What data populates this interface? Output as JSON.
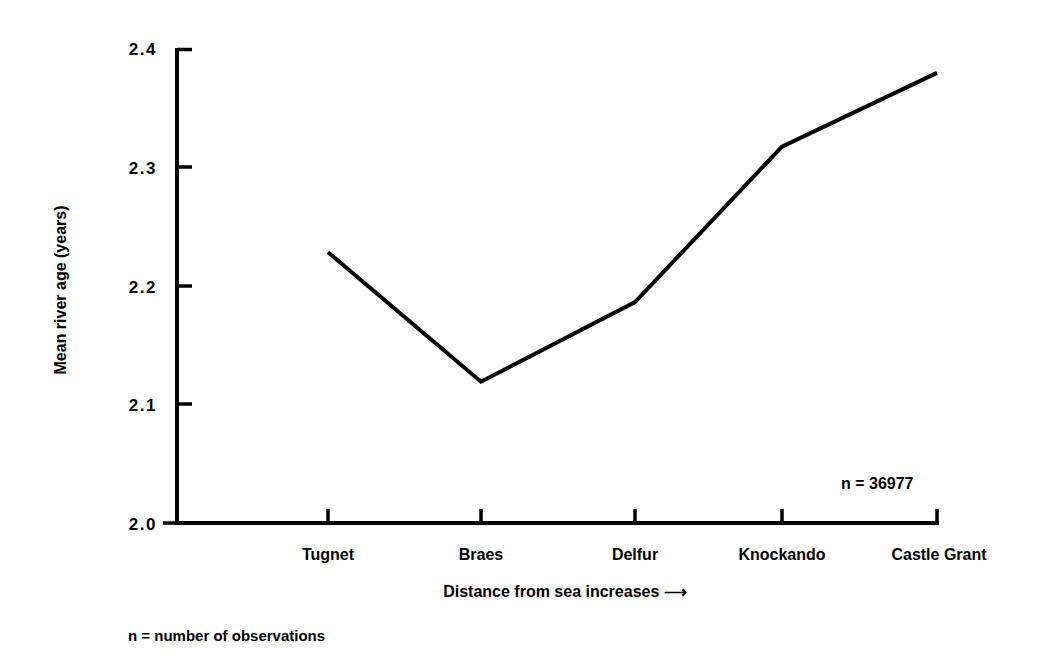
{
  "chart_data": {
    "type": "line",
    "title": "",
    "subtitle": "",
    "xlabel": "Distance from sea increases ⟶",
    "ylabel": "Mean river age (years)",
    "categories": [
      "Tugnet",
      "Braes",
      "Delfur",
      "Knockando",
      "Castle Grant"
    ],
    "values": [
      2.228,
      2.119,
      2.186,
      2.317,
      2.379
    ],
    "series": [
      {
        "name": "Mean river age",
        "values": [
          2.228,
          2.119,
          2.186,
          2.317,
          2.379
        ]
      }
    ],
    "ylim": [
      2.0,
      2.4
    ],
    "yticks": [
      2.0,
      2.1,
      2.2,
      2.3,
      2.4
    ],
    "ytick_labels": [
      "2.0",
      "2.1",
      "2.2",
      "2.3",
      "2.4"
    ],
    "xtick_labels": [
      "Tugnet",
      "Braes",
      "Delfur",
      "Knockando",
      "Castle Grant"
    ],
    "grid": false,
    "legend": "none",
    "annotations": [
      {
        "text": "n = 36977",
        "x": 0.88,
        "y": 2.041
      }
    ],
    "footnote": "n = number of observations",
    "line_color": "#000000",
    "background_color": "#ffffff"
  },
  "axes": {
    "y_tick_0": "2.0",
    "y_tick_1": "2.1",
    "y_tick_2": "2.2",
    "y_tick_3": "2.3",
    "y_tick_4": "2.4",
    "y_title": "Mean river age (years)",
    "x_title": "Distance from sea increases ⟶",
    "x_cat_0": "Tugnet",
    "x_cat_1": "Braes",
    "x_cat_2": "Delfur",
    "x_cat_3": "Knockando",
    "x_cat_4": "Castle Grant"
  },
  "annotation": {
    "n_label": "n = 36977"
  },
  "footnote": {
    "text": "n = number of observations"
  }
}
